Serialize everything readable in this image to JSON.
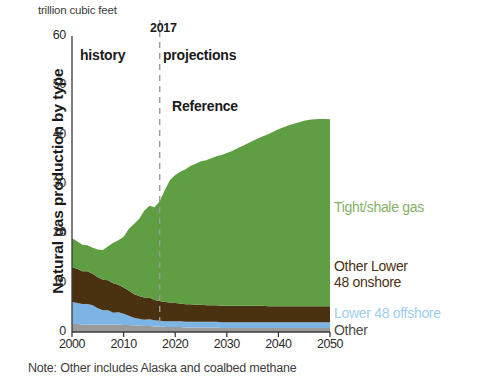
{
  "figure": {
    "units_label": "trillion cubic feet",
    "y_axis_title": "Natural gas production by type",
    "note": "Note: Other includes Alaska and coalbed methane"
  },
  "annotations": {
    "history": "history",
    "projections": "projections",
    "reference": "Reference",
    "divider_year": "2017"
  },
  "legend": {
    "tight_shale": "Tight/shale gas",
    "other_lower_48_onshore_line1": "Other Lower",
    "other_lower_48_onshore_line2": "48 onshore",
    "lower_48_offshore": "Lower 48 offshore",
    "other": "Other"
  },
  "colors": {
    "tight_shale": "#5f9e42",
    "other_lower_48_onshore": "#4a3111",
    "lower_48_offshore": "#7db4e6",
    "other": "#9a9a9a",
    "axis": "#3a3a3a",
    "divider": "#9a9a9a",
    "legend_tight_shale": "#84b168",
    "legend_onshore": "#4a3111",
    "legend_offshore": "#9fcdf0",
    "legend_other": "#4a4a4a"
  },
  "chart_data": {
    "type": "area",
    "stacked": true,
    "title": "Natural gas production by type",
    "subtitle": "trillion cubic feet",
    "xlabel": "",
    "ylabel": "Natural gas production by type",
    "units": "trillion cubic feet",
    "xlim": [
      2000,
      2050
    ],
    "ylim": [
      0,
      60
    ],
    "xticks": [
      2000,
      2010,
      2020,
      2030,
      2040,
      2050
    ],
    "yticks": [
      0,
      10,
      20,
      30,
      40,
      50,
      60
    ],
    "grid": false,
    "legend_position": "right",
    "divider": {
      "x": 2017,
      "label": "2017",
      "style": "dashed",
      "left_label": "history",
      "right_label": "projections"
    },
    "case": "Reference",
    "note": "Note: Other includes Alaska and coalbed methane",
    "x": [
      2000,
      2001,
      2002,
      2003,
      2004,
      2005,
      2006,
      2007,
      2008,
      2009,
      2010,
      2011,
      2012,
      2013,
      2014,
      2015,
      2016,
      2017,
      2018,
      2019,
      2020,
      2021,
      2022,
      2023,
      2024,
      2025,
      2026,
      2027,
      2028,
      2029,
      2030,
      2031,
      2032,
      2033,
      2034,
      2035,
      2036,
      2037,
      2038,
      2039,
      2040,
      2041,
      2042,
      2043,
      2044,
      2045,
      2046,
      2047,
      2048,
      2049,
      2050
    ],
    "series": [
      {
        "name": "Other",
        "color": "#9a9a9a",
        "values": [
          1.6,
          1.6,
          1.5,
          1.5,
          1.5,
          1.5,
          1.5,
          1.5,
          1.5,
          1.5,
          1.4,
          1.4,
          1.3,
          1.3,
          1.2,
          1.2,
          1.1,
          1.1,
          1.0,
          1.0,
          1.0,
          1.0,
          0.9,
          0.9,
          0.9,
          0.9,
          0.9,
          0.9,
          0.9,
          0.8,
          0.8,
          0.8,
          0.8,
          0.8,
          0.8,
          0.8,
          0.8,
          0.8,
          0.8,
          0.8,
          0.8,
          0.8,
          0.8,
          0.8,
          0.8,
          0.8,
          0.8,
          0.8,
          0.8,
          0.8,
          0.8
        ]
      },
      {
        "name": "Lower 48 offshore",
        "color": "#7db4e6",
        "values": [
          4.5,
          4.3,
          4.2,
          4.2,
          3.9,
          3.3,
          2.9,
          2.9,
          2.4,
          2.5,
          2.3,
          1.9,
          1.6,
          1.4,
          1.3,
          1.4,
          1.3,
          1.2,
          1.2,
          1.2,
          1.2,
          1.2,
          1.2,
          1.2,
          1.2,
          1.2,
          1.2,
          1.2,
          1.2,
          1.2,
          1.2,
          1.2,
          1.2,
          1.2,
          1.2,
          1.2,
          1.2,
          1.2,
          1.2,
          1.2,
          1.2,
          1.2,
          1.2,
          1.2,
          1.2,
          1.2,
          1.2,
          1.2,
          1.2,
          1.2,
          1.2
        ]
      },
      {
        "name": "Other Lower 48 onshore",
        "color": "#4a3111",
        "values": [
          7.0,
          6.9,
          6.6,
          6.6,
          6.4,
          6.3,
          6.2,
          6.1,
          6.0,
          5.6,
          5.3,
          5.1,
          4.8,
          4.6,
          4.5,
          4.4,
          4.1,
          4.0,
          3.9,
          3.8,
          3.7,
          3.6,
          3.5,
          3.5,
          3.4,
          3.4,
          3.3,
          3.3,
          3.3,
          3.3,
          3.3,
          3.3,
          3.3,
          3.3,
          3.3,
          3.3,
          3.3,
          3.3,
          3.2,
          3.2,
          3.2,
          3.2,
          3.2,
          3.2,
          3.2,
          3.2,
          3.2,
          3.2,
          3.2,
          3.2,
          3.2
        ]
      },
      {
        "name": "Tight/shale gas",
        "color": "#5f9e42",
        "values": [
          5.9,
          5.6,
          5.4,
          5.3,
          5.3,
          5.6,
          6.0,
          6.9,
          8.2,
          9.0,
          10.3,
          12.5,
          14.2,
          15.6,
          17.6,
          18.6,
          18.8,
          20.2,
          22.7,
          24.8,
          25.9,
          26.7,
          27.4,
          28.1,
          28.6,
          29.1,
          29.4,
          29.8,
          30.2,
          30.6,
          31.0,
          31.4,
          31.9,
          32.4,
          32.9,
          33.4,
          33.9,
          34.4,
          34.9,
          35.4,
          35.9,
          36.3,
          36.7,
          37.0,
          37.3,
          37.6,
          37.8,
          37.9,
          38.0,
          38.0,
          37.9
        ]
      }
    ],
    "totals": [
      19.0,
      18.4,
      17.7,
      17.6,
      17.1,
      16.7,
      16.6,
      17.4,
      18.1,
      18.6,
      19.3,
      20.9,
      21.9,
      22.9,
      24.6,
      25.6,
      25.3,
      26.5,
      28.8,
      30.8,
      31.8,
      32.5,
      33.0,
      33.7,
      34.1,
      34.6,
      34.8,
      35.2,
      35.6,
      35.9,
      36.3,
      36.7,
      37.2,
      37.7,
      38.2,
      38.7,
      39.2,
      39.7,
      40.1,
      40.6,
      41.1,
      41.5,
      41.9,
      42.2,
      42.5,
      42.8,
      43.0,
      43.1,
      43.2,
      43.2,
      43.1
    ]
  }
}
